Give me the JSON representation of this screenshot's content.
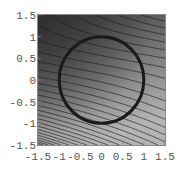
{
  "chart_data": {
    "type": "contour",
    "title": "",
    "xlabel": "",
    "ylabel": "",
    "xlim": [
      -1.5,
      1.5
    ],
    "ylim": [
      -1.5,
      1.5
    ],
    "grid": false,
    "legend": null,
    "x_ticks": [
      {
        "value": -1.5,
        "label": "-1.5"
      },
      {
        "value": -1,
        "label": "-1"
      },
      {
        "value": -0.5,
        "label": "-0.5"
      },
      {
        "value": 0,
        "label": "0"
      },
      {
        "value": 0.5,
        "label": "0.5"
      },
      {
        "value": 1,
        "label": "1"
      },
      {
        "value": 1.5,
        "label": "1.5"
      }
    ],
    "y_ticks": [
      {
        "value": 1.5,
        "label": "1.5"
      },
      {
        "value": 1,
        "label": "1"
      },
      {
        "value": 0.5,
        "label": "0.5"
      },
      {
        "value": 0,
        "label": "0"
      },
      {
        "value": -0.5,
        "label": "-0.5"
      },
      {
        "value": -1,
        "label": "-1"
      },
      {
        "value": -1.5,
        "label": "-1.5"
      }
    ],
    "shading": {
      "colormap": "grayscale",
      "dark_color": "#3a3a3a",
      "light_color": "#b4b4b4",
      "darkest_region": "upper-left",
      "lightest_region": "bottom"
    },
    "overlay": {
      "shape": "circle",
      "center": [
        0,
        0
      ],
      "radius": 1,
      "color": "#1a1a1a",
      "stroke_width": 3
    },
    "contour_count_approx": 30,
    "contour_color": "#1e1e1e"
  },
  "colors": {
    "background": "#ffffff",
    "frame": "#888888",
    "tick_label": "#555555"
  }
}
